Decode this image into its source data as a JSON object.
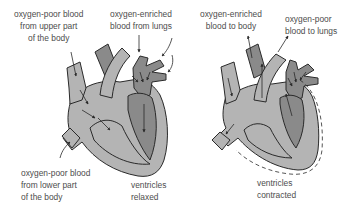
{
  "figure": {
    "left_panel": {
      "state": "ventricles relaxed",
      "labels": {
        "upper_body": [
          "oxygen-poor blood",
          "from upper part",
          "of the body"
        ],
        "lungs_in": [
          "oxygen-enriched",
          "blood from lungs"
        ],
        "lower_body": [
          "oxygen-poor blood",
          "from lower part",
          "of the body"
        ],
        "caption": [
          "ventricles",
          "relaxed"
        ]
      }
    },
    "right_panel": {
      "state": "ventricles contracted",
      "labels": {
        "to_body": [
          "oxygen-enriched",
          "blood to body"
        ],
        "to_lungs": [
          "oxygen-poor",
          "blood to lungs"
        ],
        "caption": [
          "ventricles",
          "contracted"
        ]
      }
    },
    "colors": {
      "oxygen_poor_fill": "#b4b4b4",
      "oxygen_rich_fill": "#8a8a8a",
      "outline": "#2a2a2a",
      "text": "#4d4d4d"
    }
  }
}
